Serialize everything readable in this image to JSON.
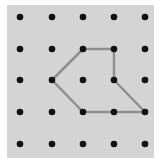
{
  "diagram": {
    "type": "geoboard",
    "grid": {
      "cols": 5,
      "rows": 5
    },
    "dot_x": [
      20,
      52,
      83,
      114,
      145
    ],
    "dot_y": [
      17,
      49,
      80,
      112,
      144
    ],
    "shape": {
      "name": "pentagon",
      "vertices": [
        [
          2,
          1
        ],
        [
          3,
          1
        ],
        [
          3,
          2
        ],
        [
          4,
          3
        ],
        [
          2,
          3
        ],
        [
          1,
          2
        ]
      ]
    },
    "colors": {
      "board": "#d4d4d4",
      "dot": "#111111",
      "band": "#8e8e8e"
    }
  }
}
